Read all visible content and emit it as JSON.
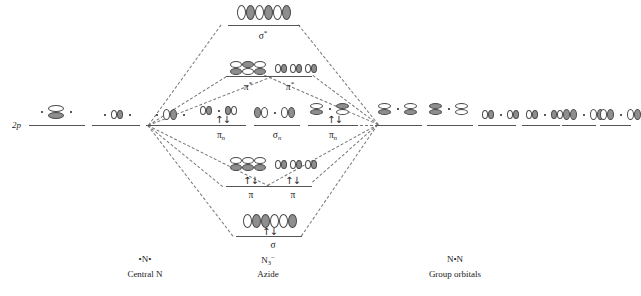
{
  "diagram": {
    "title_left_axis": "2p",
    "columns": {
      "left": {
        "caption_atom": "•N•",
        "caption_name": "Central N"
      },
      "center": {
        "caption_atom": "N3−",
        "caption_name": "Azide"
      },
      "right": {
        "caption_atom": "N•N",
        "caption_name": "Group orbitals"
      }
    },
    "mo_labels": {
      "sigma_star": "σ*",
      "pi_star_left": "π*",
      "pi_star_right": "π*",
      "pi_n_left": "πn",
      "sigma_n": "σn",
      "pi_n_right": "πn",
      "pi_left": "π",
      "pi_right": "π",
      "sigma": "σ"
    },
    "electron_pair_symbol": "↑↓",
    "occupancies": {
      "sigma_star": "",
      "pi_star_left": "",
      "pi_star_right": "",
      "pi_n_left": "↑↓",
      "sigma_n": "",
      "pi_n_right": "↑↓",
      "pi_left": "↑↓",
      "pi_right": "↑↓",
      "sigma": "↑↓"
    },
    "colors": {
      "lobe_positive": "#ffffff",
      "lobe_negative": "#8e8e8e",
      "lobe_outline": "#4a4a4a",
      "level_line": "#555555",
      "connector": "#777777",
      "text": "#1a1a1a",
      "background": "#ffffff"
    },
    "left_levels": [
      {
        "name": "2p-level-1",
        "orbital": "p-vertical-with-dots"
      },
      {
        "name": "2p-level-2",
        "orbital": "p-horizontal-with-dots"
      },
      {
        "name": "2p-level-3",
        "orbital": "p-inplane-with-dots"
      }
    ],
    "right_levels": [
      {
        "name": "group-orbital-1",
        "orbital": "pi-star-pair"
      },
      {
        "name": "group-orbital-2",
        "orbital": "pi-pair"
      },
      {
        "name": "group-orbital-3",
        "orbital": "p-sigma-antibonding"
      },
      {
        "name": "group-orbital-4",
        "orbital": "p-sigma-bonding"
      },
      {
        "name": "group-orbital-5",
        "orbital": "sigma-star-pair"
      },
      {
        "name": "group-orbital-6",
        "orbital": "sigma-pair"
      }
    ]
  }
}
